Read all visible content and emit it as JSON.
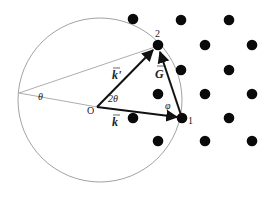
{
  "diagram": {
    "colors": {
      "circle": "#8a8a8a",
      "guide_lines": "#8a8a8a",
      "vectors": "#111111",
      "lattice_points": "#0a0a0a",
      "text": "#222222"
    },
    "circle": {
      "cx": 100,
      "cy": 100,
      "r": 82
    },
    "origin": {
      "label": "O",
      "x": 97,
      "y": 107
    },
    "left_point": {
      "x": 19,
      "y": 93
    },
    "points": {
      "p1": {
        "label": "1",
        "x": 182,
        "y": 118
      },
      "p2": {
        "label": "2",
        "x": 158,
        "y": 45
      }
    },
    "vectors": [
      {
        "name": "k",
        "label": "k",
        "from": "origin",
        "to": "p1"
      },
      {
        "name": "k_prime",
        "label": "k'",
        "from": "origin",
        "to": "p2"
      },
      {
        "name": "G",
        "label": "G",
        "from": "p1",
        "to": "p2"
      }
    ],
    "angles": {
      "theta": "θ",
      "two_theta": "2θ",
      "phi": "φ"
    },
    "lattice": [
      {
        "x": 133,
        "y": 19
      },
      {
        "x": 181,
        "y": 20
      },
      {
        "x": 229,
        "y": 20
      },
      {
        "x": 158,
        "y": 45
      },
      {
        "x": 205,
        "y": 45
      },
      {
        "x": 252,
        "y": 45
      },
      {
        "x": 181,
        "y": 70
      },
      {
        "x": 229,
        "y": 70
      },
      {
        "x": 158,
        "y": 94
      },
      {
        "x": 205,
        "y": 94
      },
      {
        "x": 252,
        "y": 94
      },
      {
        "x": 133,
        "y": 118
      },
      {
        "x": 182,
        "y": 118
      },
      {
        "x": 229,
        "y": 118
      },
      {
        "x": 158,
        "y": 141
      },
      {
        "x": 205,
        "y": 141
      },
      {
        "x": 252,
        "y": 141
      }
    ]
  }
}
